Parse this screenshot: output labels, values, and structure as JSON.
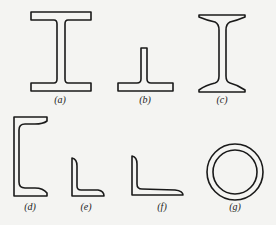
{
  "figure": {
    "background": "#f4f4f2",
    "stroke_color": "#1a1a1a",
    "sections": [
      {
        "id": "a",
        "label": "(a)",
        "shape": "rolled I-beam (wide flange)",
        "label_x": 60,
        "label_y": 94
      },
      {
        "id": "b",
        "label": "(b)",
        "shape": "T-section",
        "label_x": 145,
        "label_y": 94
      },
      {
        "id": "c",
        "label": "(c)",
        "shape": "tapered-flange I-beam",
        "label_x": 222,
        "label_y": 94
      },
      {
        "id": "d",
        "label": "(d)",
        "shape": "channel section",
        "label_x": 30,
        "label_y": 201
      },
      {
        "id": "e",
        "label": "(e)",
        "shape": "equal angle",
        "label_x": 86,
        "label_y": 201
      },
      {
        "id": "f",
        "label": "(f)",
        "shape": "unequal angle",
        "label_x": 162,
        "label_y": 201
      },
      {
        "id": "g",
        "label": "(g)",
        "shape": "circular hollow tube",
        "label_x": 235,
        "label_y": 201
      }
    ]
  }
}
